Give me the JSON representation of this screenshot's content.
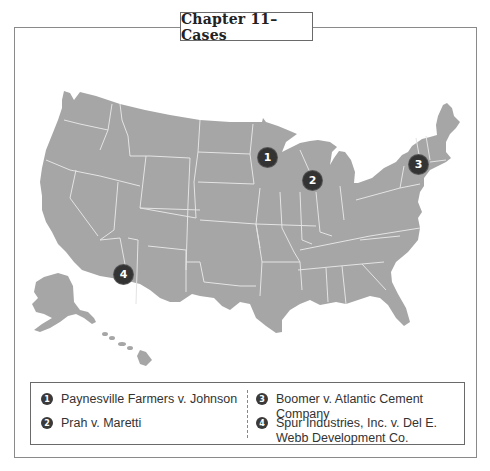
{
  "title": "Chapter 11–Cases",
  "map": {
    "land_color": "#a6a6a6",
    "border_color": "#e4e4e4",
    "marker_color": "#333333",
    "regions_shown": [
      "Contiguous United States",
      "Alaska",
      "Hawaii"
    ]
  },
  "markers": [
    {
      "number": "1",
      "state": "Minnesota",
      "x": 267,
      "y": 157
    },
    {
      "number": "2",
      "state": "Illinois/Wisconsin",
      "x": 312,
      "y": 180
    },
    {
      "number": "3",
      "state": "New York",
      "x": 418,
      "y": 164
    },
    {
      "number": "4",
      "state": "Arizona",
      "x": 123,
      "y": 274
    }
  ],
  "legend": {
    "items": [
      {
        "number": "1",
        "label": "Paynesville Farmers v. Johnson"
      },
      {
        "number": "2",
        "label": "Prah v. Maretti"
      },
      {
        "number": "3",
        "label": "Boomer v. Atlantic Cement Company"
      },
      {
        "number": "4",
        "label": "Spur Industries, Inc. v. Del E. Webb Development Co."
      }
    ]
  }
}
